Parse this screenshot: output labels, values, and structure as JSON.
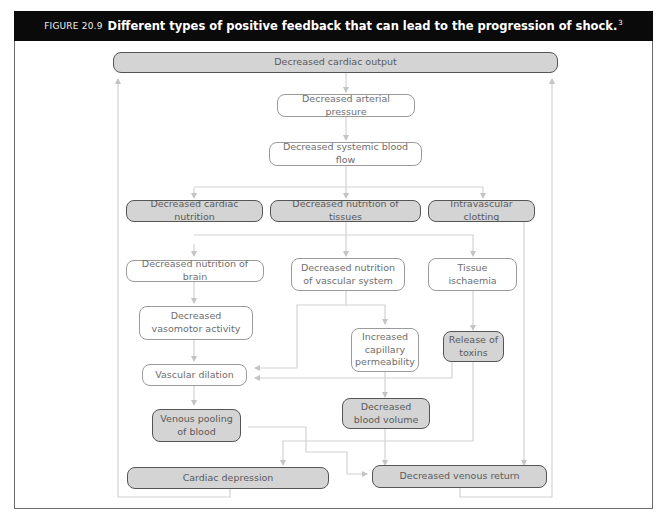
{
  "figure": {
    "label": "FIGURE 20.9",
    "title": "Different types of positive feedback that can lead to the progression of shock.",
    "superscript": "3"
  },
  "nodes": {
    "cardiac_output": "Decreased cardiac output",
    "arterial_pressure": "Decreased arterial pressure",
    "systemic_flow": "Decreased systemic blood flow",
    "cardiac_nutrition": "Decreased cardiac nutrition",
    "tissue_nutrition": "Decreased nutrition of tissues",
    "intravascular_clotting": "Intravascular clotting",
    "brain_nutrition": "Decreased nutrition of brain",
    "vascular_nutrition": "Decreased nutrition of vascular system",
    "tissue_ischaemia": "Tissue ischaemia",
    "vasomotor_activity": "Decreased vasomotor activity",
    "capillary_permeability": "Increased capillary permeability",
    "release_toxins": "Release of toxins",
    "vascular_dilation": "Vascular dilation",
    "venous_pooling": "Venous pooling of blood",
    "blood_volume": "Decreased blood volume",
    "cardiac_depression": "Cardiac depression",
    "venous_return": "Decreased venous return"
  },
  "colors": {
    "header_bg": "#0a0a0a",
    "highlight_fill": "#d4d4d4",
    "plain_fill": "#ffffff",
    "connector": "#cfcfcf"
  }
}
